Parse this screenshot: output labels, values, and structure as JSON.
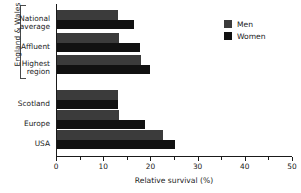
{
  "chart_data": {
    "type": "bar",
    "title": "",
    "orientation": "horizontal",
    "xlabel": "Relative survival (%)",
    "ylabel": "",
    "xlim": [
      0,
      50
    ],
    "xticks": [
      0,
      10,
      20,
      30,
      40,
      50
    ],
    "xtick_labels": [
      "0",
      "10",
      "20",
      "30",
      "40",
      "50"
    ],
    "xminor_ticks": [
      5,
      15,
      25,
      35,
      45
    ],
    "grid": false,
    "legend_position": "top-right",
    "categories": [
      "National\naverage",
      "Affluent",
      "Highest\nregion",
      "Scotland",
      "Europe",
      "USA"
    ],
    "series": [
      {
        "name": "Men",
        "color": "#3b3b3b",
        "values": [
          13.2,
          13.4,
          18.1,
          13.2,
          13.4,
          22.7
        ]
      },
      {
        "name": "Women",
        "color": "#111111",
        "values": [
          16.6,
          17.7,
          20.0,
          13.2,
          18.8,
          25.3
        ]
      }
    ],
    "group_bracket": {
      "label": "England & Wales",
      "spans_categories": [
        "National\naverage",
        "Affluent",
        "Highest\nregion"
      ]
    }
  },
  "legend": {
    "items": [
      {
        "label": "Men",
        "color": "#3b3b3b"
      },
      {
        "label": "Women",
        "color": "#111111"
      }
    ]
  }
}
